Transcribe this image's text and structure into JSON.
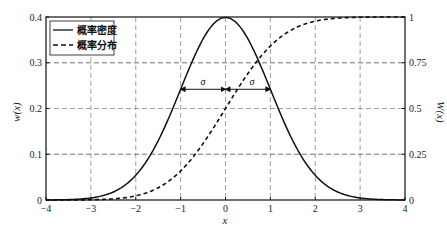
{
  "chart_data": {
    "type": "line",
    "title": "",
    "xlabel": "x",
    "ylabel": "w(x)",
    "ylabel_right": "W(x)",
    "xlim": [
      -4,
      4
    ],
    "ylim": [
      0,
      0.4
    ],
    "ylim_right": [
      0,
      1
    ],
    "grid": true,
    "legend_position": "upper left",
    "xticks": [
      "-4",
      "-3",
      "-2",
      "-1",
      "0",
      "1",
      "2",
      "3",
      "4"
    ],
    "yticks": [
      "0",
      "0.1",
      "0.2",
      "0.3",
      "0.4"
    ],
    "yticks_right": [
      "0",
      "0.25",
      "0.5",
      "0.75",
      "1"
    ],
    "x": [
      -4,
      -3.5,
      -3,
      -2.5,
      -2,
      -1.5,
      -1,
      -0.5,
      0,
      0.5,
      1,
      1.5,
      2,
      2.5,
      3,
      3.5,
      4
    ],
    "series": [
      {
        "name": "概率密度",
        "style": "solid",
        "axis": "left",
        "values": [
          0.0001,
          0.0009,
          0.0044,
          0.0175,
          0.054,
          0.1295,
          0.242,
          0.3521,
          0.3989,
          0.3521,
          0.242,
          0.1295,
          0.054,
          0.0175,
          0.0044,
          0.0009,
          0.0001
        ]
      },
      {
        "name": "概率分布",
        "style": "dashed",
        "axis": "right",
        "values": [
          0.0,
          0.0002,
          0.0013,
          0.0062,
          0.0228,
          0.0668,
          0.1587,
          0.3085,
          0.5,
          0.6915,
          0.8413,
          0.9332,
          0.9772,
          0.9938,
          0.9987,
          0.9998,
          1.0
        ]
      }
    ],
    "annotations": [
      {
        "text": "σ",
        "from_x": -1,
        "to_x": 0,
        "y": 0.242
      },
      {
        "text": "σ",
        "from_x": 0,
        "to_x": 1,
        "y": 0.242
      }
    ]
  },
  "legend": {
    "items": [
      {
        "label": "概率密度",
        "style": "solid"
      },
      {
        "label": "概率分布",
        "style": "dashed"
      }
    ]
  },
  "labels": {
    "xlabel": "x",
    "ylabel_left": "w(x)",
    "ylabel_right": "W(x)",
    "sigma_left": "σ",
    "sigma_right": "σ"
  }
}
